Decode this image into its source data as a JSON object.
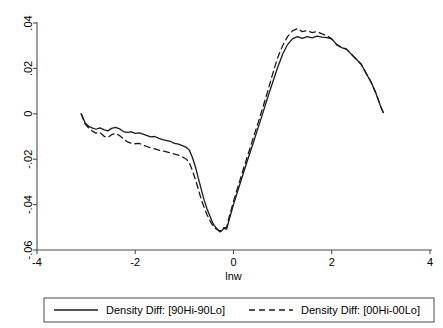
{
  "chart_data": {
    "type": "line",
    "title": "",
    "subtitle": "",
    "xlabel": "lnw",
    "ylabel": "",
    "xlim": [
      -4,
      4
    ],
    "ylim": [
      -0.06,
      0.04
    ],
    "xticks": [
      -4,
      -2,
      0,
      2,
      4
    ],
    "xtick_labels": [
      "-4",
      "-2",
      "0",
      "2",
      "4"
    ],
    "yticks": [
      0.04,
      0.02,
      0,
      -0.02,
      -0.04,
      -0.06
    ],
    "ytick_labels": [
      ".04",
      ".02",
      "0",
      "-.02",
      "-.04",
      "-.06"
    ],
    "grid": false,
    "legend_position": "bottom",
    "series": [
      {
        "name": "Density Diff: [90Hi-90Lo]",
        "style": "solid",
        "color": "#1a1a1a",
        "x": [
          -3.1,
          -3.02,
          -2.95,
          -2.88,
          -2.8,
          -2.72,
          -2.64,
          -2.56,
          -2.48,
          -2.4,
          -2.32,
          -2.24,
          -2.16,
          -2.08,
          -2.0,
          -1.92,
          -1.84,
          -1.76,
          -1.68,
          -1.6,
          -1.52,
          -1.44,
          -1.36,
          -1.28,
          -1.2,
          -1.12,
          -1.04,
          -0.96,
          -0.9,
          -0.84,
          -0.78,
          -0.72,
          -0.66,
          -0.6,
          -0.54,
          -0.48,
          -0.44,
          -0.4,
          -0.36,
          -0.32,
          -0.28,
          -0.24,
          -0.2,
          -0.14,
          -0.08,
          0.0,
          0.1,
          0.2,
          0.3,
          0.4,
          0.5,
          0.6,
          0.7,
          0.8,
          0.9,
          1.0,
          1.1,
          1.2,
          1.3,
          1.4,
          1.5,
          1.6,
          1.7,
          1.8,
          1.9,
          2.0,
          2.1,
          2.2,
          2.3,
          2.4,
          2.5,
          2.6,
          2.7,
          2.8,
          2.9,
          3.0,
          3.05
        ],
        "y": [
          0.0,
          -0.004,
          -0.0055,
          -0.0062,
          -0.0068,
          -0.0062,
          -0.007,
          -0.0075,
          -0.0064,
          -0.006,
          -0.0066,
          -0.0078,
          -0.0082,
          -0.008,
          -0.0086,
          -0.0084,
          -0.009,
          -0.0096,
          -0.0102,
          -0.01,
          -0.0108,
          -0.0114,
          -0.0118,
          -0.0122,
          -0.013,
          -0.0134,
          -0.014,
          -0.0148,
          -0.016,
          -0.019,
          -0.023,
          -0.028,
          -0.033,
          -0.0378,
          -0.0418,
          -0.045,
          -0.0472,
          -0.049,
          -0.05,
          -0.051,
          -0.052,
          -0.0516,
          -0.0505,
          -0.0508,
          -0.046,
          -0.04,
          -0.033,
          -0.0262,
          -0.0195,
          -0.013,
          -0.0062,
          0.0005,
          0.0075,
          0.014,
          0.0205,
          0.0262,
          0.0305,
          0.033,
          0.034,
          0.0332,
          0.034,
          0.0335,
          0.0342,
          0.0338,
          0.0336,
          0.033,
          0.0305,
          0.0292,
          0.0285,
          0.0262,
          0.024,
          0.0218,
          0.0178,
          0.014,
          0.009,
          0.003,
          0.0005
        ]
      },
      {
        "name": "Density Diff: [00Hi-00Lo]",
        "style": "dashed",
        "color": "#1a1a1a",
        "x": [
          -3.1,
          -3.02,
          -2.95,
          -2.88,
          -2.8,
          -2.72,
          -2.64,
          -2.56,
          -2.48,
          -2.4,
          -2.32,
          -2.24,
          -2.16,
          -2.08,
          -2.0,
          -1.92,
          -1.84,
          -1.76,
          -1.68,
          -1.6,
          -1.52,
          -1.44,
          -1.36,
          -1.28,
          -1.2,
          -1.12,
          -1.04,
          -0.96,
          -0.9,
          -0.84,
          -0.78,
          -0.72,
          -0.66,
          -0.6,
          -0.54,
          -0.48,
          -0.44,
          -0.4,
          -0.36,
          -0.32,
          -0.28,
          -0.24,
          -0.2,
          -0.14,
          -0.08,
          0.0,
          0.1,
          0.2,
          0.3,
          0.4,
          0.5,
          0.6,
          0.7,
          0.8,
          0.9,
          1.0,
          1.1,
          1.2,
          1.3,
          1.4,
          1.5,
          1.6,
          1.7,
          1.8,
          1.9,
          2.0,
          2.1,
          2.2,
          2.3,
          2.4,
          2.5,
          2.6,
          2.7,
          2.8,
          2.9,
          3.0,
          3.05
        ],
        "y": [
          0.0,
          -0.0045,
          -0.0062,
          -0.0075,
          -0.0085,
          -0.0082,
          -0.0098,
          -0.0104,
          -0.0092,
          -0.0086,
          -0.0096,
          -0.011,
          -0.0124,
          -0.013,
          -0.0132,
          -0.013,
          -0.0138,
          -0.0144,
          -0.015,
          -0.0155,
          -0.016,
          -0.0164,
          -0.0168,
          -0.0172,
          -0.0178,
          -0.0182,
          -0.019,
          -0.02,
          -0.0215,
          -0.0248,
          -0.0286,
          -0.033,
          -0.0374,
          -0.0412,
          -0.0444,
          -0.047,
          -0.0486,
          -0.0498,
          -0.0506,
          -0.0512,
          -0.0516,
          -0.0512,
          -0.0502,
          -0.05,
          -0.0448,
          -0.0386,
          -0.0314,
          -0.0244,
          -0.0176,
          -0.0108,
          -0.004,
          0.003,
          0.0102,
          0.0178,
          0.0248,
          0.03,
          0.034,
          0.0365,
          0.0375,
          0.0362,
          0.0366,
          0.0358,
          0.0362,
          0.0352,
          0.0344,
          0.033,
          0.0305,
          0.0292,
          0.0285,
          0.0262,
          0.024,
          0.0218,
          0.0178,
          0.014,
          0.009,
          0.003,
          0.0005
        ]
      }
    ],
    "legend": [
      {
        "label": "Density Diff: [90Hi-90Lo]",
        "style": "solid"
      },
      {
        "label": "Density Diff: [00Hi-00Lo]",
        "style": "dashed"
      }
    ]
  }
}
